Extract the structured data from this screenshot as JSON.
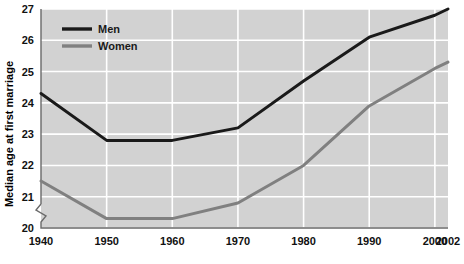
{
  "chart_data": {
    "type": "line",
    "title": "",
    "xlabel": "",
    "ylabel": "Median age at first marriage",
    "x": [
      1940,
      1950,
      1960,
      1970,
      1980,
      1990,
      2000,
      2002
    ],
    "xtick_labels": [
      "1940",
      "1950",
      "1960",
      "1970",
      "1980",
      "1990",
      "2000",
      "2002"
    ],
    "ytick_labels": [
      "20",
      "21",
      "22",
      "23",
      "24",
      "25",
      "26",
      "27"
    ],
    "ylim": [
      20,
      27
    ],
    "xlim": [
      1940,
      2002
    ],
    "y_axis_break": true,
    "grid": true,
    "legend_position": "top-left",
    "series": [
      {
        "name": "Men",
        "color": "#1a1a1a",
        "values": [
          24.3,
          22.8,
          22.8,
          23.2,
          24.7,
          26.1,
          26.8,
          27.0
        ]
      },
      {
        "name": "Women",
        "color": "#808080",
        "values": [
          21.5,
          20.3,
          20.3,
          20.8,
          22.0,
          23.9,
          25.1,
          25.3
        ]
      }
    ],
    "colors": {
      "plot_background": "#d2d2d2",
      "gridline": "#ffffff",
      "axis": "#555555",
      "page_background": "#ffffff"
    }
  }
}
